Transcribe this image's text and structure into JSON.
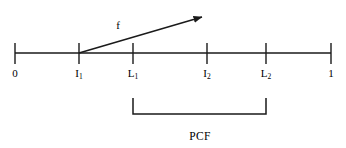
{
  "figure": {
    "colors": {
      "stroke": "#1a1a1a",
      "background": "#ffffff",
      "text": "#000000"
    },
    "axis": {
      "name": "unit-interval-axis",
      "start_value": "0",
      "end_value": "1",
      "x1": 15,
      "x2": 331,
      "y": 53,
      "stroke_width": 1.6
    },
    "ticks": [
      {
        "id": "tick-0",
        "label": "0",
        "sub": "",
        "x": 15,
        "label_x": 15,
        "label_y": 68
      },
      {
        "id": "tick-I1",
        "label": "I",
        "sub": "1",
        "x": 79,
        "label_x": 79,
        "label_y": 68
      },
      {
        "id": "tick-L1",
        "label": "L",
        "sub": "1",
        "x": 133,
        "label_x": 133,
        "label_y": 68
      },
      {
        "id": "tick-I2",
        "label": "I",
        "sub": "2",
        "x": 207,
        "label_x": 207,
        "label_y": 68
      },
      {
        "id": "tick-L2",
        "label": "L",
        "sub": "2",
        "x": 266,
        "label_x": 266,
        "label_y": 68
      },
      {
        "id": "tick-1",
        "label": "1",
        "sub": "",
        "x": 331,
        "label_x": 331,
        "label_y": 68
      }
    ],
    "tick_geometry": {
      "top_y": 43,
      "bottom_y": 64,
      "stroke_width": 1.4
    },
    "arrow": {
      "name": "map-arrow-f",
      "label": "f",
      "label_x": 118,
      "label_y": 20,
      "from_x": 79,
      "from_y": 53,
      "to_x": 202,
      "to_y": 17,
      "stroke_width": 1.5
    },
    "bracket": {
      "name": "pcf-bracket",
      "label": "PCF",
      "left_x": 133,
      "right_x": 266,
      "bar_y": 114,
      "leg_top_y": 98,
      "stroke_width": 1.5,
      "label_x": 200,
      "label_y": 131
    }
  }
}
